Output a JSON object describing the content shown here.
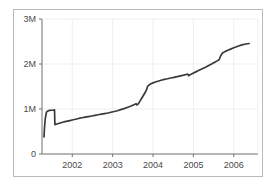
{
  "chart_data": {
    "type": "line",
    "title": "",
    "subtitle": "",
    "xlabel": "",
    "ylabel": "",
    "xlim": [
      2001.25,
      2006.6
    ],
    "ylim": [
      0,
      3000000
    ],
    "grid": true,
    "legend": null,
    "yticks": [
      0,
      1000000,
      2000000,
      3000000
    ],
    "ytick_labels": [
      "0",
      "1M",
      "2M",
      "3M"
    ],
    "xticks": [
      2002,
      2003,
      2004,
      2005,
      2006
    ],
    "xtick_labels": [
      "2002",
      "2003",
      "2004",
      "2005",
      "2006"
    ],
    "series": [
      {
        "name": "cumulative total",
        "color": "#3a3a3a",
        "x": [
          2001.3,
          2001.31,
          2001.33,
          2001.36,
          2001.4,
          2001.44,
          2001.48,
          2001.52,
          2001.55,
          2001.56,
          2001.57,
          2001.6,
          2001.64,
          2001.7,
          2001.76,
          2001.82,
          2001.88,
          2001.94,
          2002.0,
          2002.08,
          2002.16,
          2002.24,
          2002.32,
          2002.4,
          2002.48,
          2002.56,
          2002.64,
          2002.72,
          2002.8,
          2002.88,
          2002.96,
          2003.04,
          2003.12,
          2003.2,
          2003.28,
          2003.36,
          2003.44,
          2003.5,
          2003.55,
          2003.58,
          2003.6,
          2003.64,
          2003.68,
          2003.72,
          2003.76,
          2003.8,
          2003.84,
          2003.86,
          2003.88,
          2003.92,
          2003.96,
          2004.0,
          2004.06,
          2004.12,
          2004.2,
          2004.28,
          2004.36,
          2004.44,
          2004.52,
          2004.6,
          2004.68,
          2004.76,
          2004.82,
          2004.86,
          2004.88,
          2004.92,
          2004.98,
          2005.06,
          2005.14,
          2005.22,
          2005.3,
          2005.38,
          2005.46,
          2005.54,
          2005.6,
          2005.64,
          2005.68,
          2005.72,
          2005.78,
          2005.84,
          2005.92,
          2006.0,
          2006.1,
          2006.2,
          2006.3,
          2006.38
        ],
        "y": [
          380000,
          560000,
          780000,
          930000,
          960000,
          968000,
          972000,
          975000,
          978000,
          980000,
          650000,
          660000,
          672000,
          690000,
          705000,
          718000,
          730000,
          742000,
          755000,
          772000,
          790000,
          805000,
          818000,
          832000,
          845000,
          858000,
          872000,
          885000,
          898000,
          912000,
          928000,
          945000,
          962000,
          985000,
          1008000,
          1035000,
          1062000,
          1085000,
          1105000,
          1118000,
          1090000,
          1120000,
          1180000,
          1240000,
          1300000,
          1360000,
          1430000,
          1490000,
          1520000,
          1545000,
          1565000,
          1580000,
          1600000,
          1618000,
          1640000,
          1658000,
          1672000,
          1688000,
          1702000,
          1718000,
          1735000,
          1752000,
          1768000,
          1778000,
          1740000,
          1760000,
          1790000,
          1825000,
          1860000,
          1895000,
          1930000,
          1968000,
          2005000,
          2045000,
          2075000,
          2100000,
          2190000,
          2245000,
          2275000,
          2300000,
          2330000,
          2360000,
          2395000,
          2425000,
          2445000,
          2455000
        ]
      }
    ]
  },
  "axes": {
    "y_tick_0": "0",
    "y_tick_1m": "1M",
    "y_tick_2m": "2M",
    "y_tick_3m": "3M",
    "x_tick_2002": "2002",
    "x_tick_2003": "2003",
    "x_tick_2004": "2004",
    "x_tick_2005": "2005",
    "x_tick_2006": "2006"
  },
  "colors": {
    "line": "#3a3a3a",
    "axis": "#6e6e6e",
    "grid": "#efefef",
    "frame": "#b9b9b9",
    "background": "#ffffff",
    "text": "#4a4a4a"
  }
}
